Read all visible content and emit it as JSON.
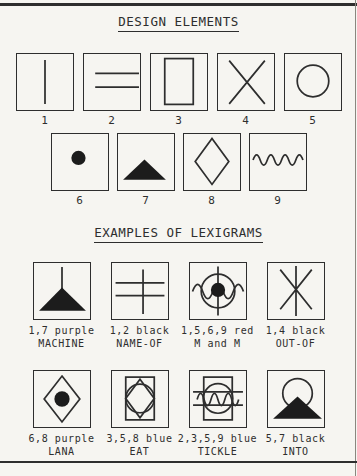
{
  "figure": {
    "design_title": "DESIGN ELEMENTS",
    "lexigram_title": "EXAMPLES OF LEXIGRAMS"
  },
  "colors": {
    "ink": "#2e2e2e",
    "paper": "#f6f5f1",
    "fill": "#1c1c1c"
  },
  "design_elements": [
    {
      "number": "1",
      "icon": "vertical-line"
    },
    {
      "number": "2",
      "icon": "two-horizontal-lines"
    },
    {
      "number": "3",
      "icon": "rectangle-outline"
    },
    {
      "number": "4",
      "icon": "diagonal-cross"
    },
    {
      "number": "5",
      "icon": "circle-outline"
    },
    {
      "number": "6",
      "icon": "filled-dot"
    },
    {
      "number": "7",
      "icon": "filled-triangle"
    },
    {
      "number": "8",
      "icon": "diamond-outline"
    },
    {
      "number": "9",
      "icon": "wavy-line"
    }
  ],
  "lexigrams": [
    {
      "elements": "1,7 purple",
      "name": "MACHINE",
      "icon": "line-and-filled-triangle"
    },
    {
      "elements": "1,2 black",
      "name": "NAME-OF",
      "icon": "vertical-line-two-horizontals"
    },
    {
      "elements": "1,5,6,9 red",
      "name": "M and M",
      "icon": "circle-dot-line-wave"
    },
    {
      "elements": "1,4 black",
      "name": "OUT-OF",
      "icon": "vertical-line-diagonal-cross"
    },
    {
      "elements": "6,8 purple",
      "name": "LANA",
      "icon": "diamond-with-dot"
    },
    {
      "elements": "3,5,8 blue",
      "name": "EAT",
      "icon": "rect-circle-diamond"
    },
    {
      "elements": "2,3,5,9 blue",
      "name": "TICKLE",
      "icon": "rect-circle-lines-wave"
    },
    {
      "elements": "5,7 black",
      "name": "INTO",
      "icon": "circle-with-filled-triangle"
    }
  ]
}
